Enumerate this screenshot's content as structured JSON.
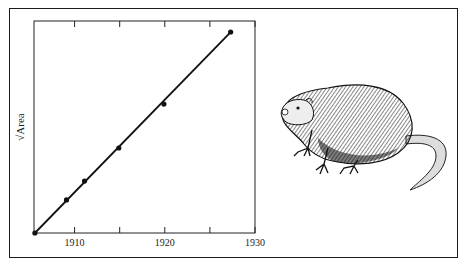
{
  "chart_data": {
    "type": "line",
    "title": "",
    "xlabel": "",
    "ylabel": "√Area",
    "xlim": [
      1905.5,
      1930
    ],
    "ylim": [
      0,
      100
    ],
    "x_ticks": [
      1910,
      1915,
      1920,
      1925,
      1930
    ],
    "x_tick_labels": [
      "1910",
      "",
      "1920",
      "",
      "1930"
    ],
    "grid": false,
    "legend": null,
    "series": [
      {
        "name": "√Area (observed)",
        "markers": true,
        "x": [
          1905.6,
          1909.1,
          1911.1,
          1914.9,
          1919.9,
          1927.3
        ],
        "y": [
          0,
          15.6,
          24.5,
          40.1,
          60.8,
          94.8
        ]
      },
      {
        "name": "linear fit",
        "markers": false,
        "x": [
          1905.6,
          1927.3
        ],
        "y": [
          0,
          94.8
        ]
      }
    ]
  },
  "illustration": {
    "subject": "muskrat",
    "style": "pen-and-ink engraving"
  }
}
